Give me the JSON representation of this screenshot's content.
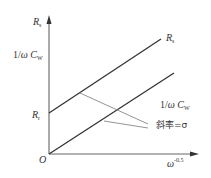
{
  "diagram": {
    "type": "line-diagram",
    "axes": {
      "y_label": {
        "main": "R",
        "sub": "s"
      },
      "x_label": {
        "main": "ω",
        "sup": "-0.5"
      },
      "origin": "O"
    },
    "y_tick_labels": {
      "upper": {
        "prefix": "1/",
        "omega": "ω",
        "c": "C",
        "sub": "W"
      },
      "intercept": {
        "main": "R",
        "sub": "r"
      }
    },
    "lines": [
      {
        "name": "Rs-line",
        "label": {
          "main": "R",
          "sub": "s"
        },
        "intercept": "Rr"
      },
      {
        "name": "inverse-omega-Cw-line",
        "label": {
          "prefix": "1/",
          "omega": "ω",
          "c": "C",
          "sub": "W"
        },
        "intercept": "0"
      }
    ],
    "annotation": {
      "text": "斜率=σ",
      "meaning": "slope = sigma"
    },
    "colors": {
      "axis": "#555555",
      "line": "#333333",
      "pointer": "#888888"
    }
  }
}
